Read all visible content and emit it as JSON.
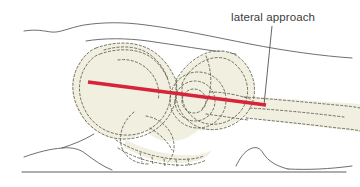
{
  "figure": {
    "type": "anatomical-line-diagram",
    "background_color": "#ffffff",
    "width": 360,
    "height": 187
  },
  "annotation": {
    "label": "lateral approach",
    "label_color": "#3b3b3b",
    "leader_line_color": "#555555",
    "leader_start": [
      272,
      26
    ],
    "leader_end": [
      264,
      105
    ]
  },
  "approach_line": {
    "name": "lateral approach trajectory",
    "color": "#d6243a",
    "width": 3.4,
    "start": [
      88,
      82
    ],
    "end": [
      266,
      105
    ]
  },
  "bone": {
    "fill_color": "#f0efe0",
    "outline_color": "#5a5a4a",
    "outline_style": "dashed",
    "parts": [
      "ilium",
      "acetabulum",
      "femoral head",
      "greater trochanter",
      "femoral shaft",
      "ischium",
      "sacrum",
      "coccyx"
    ]
  },
  "body_contours": {
    "color": "#4a4a4a",
    "description": "thin solid skin-surface outlines of torso, flank, buttock and thigh",
    "table_line_y": 172
  }
}
